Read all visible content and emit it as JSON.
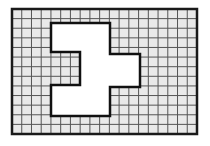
{
  "diagram": {
    "type": "grid-shape",
    "grid": {
      "cols": 19,
      "rows": 13,
      "x": 12,
      "y": 9,
      "width": 185,
      "height": 125,
      "fill": "#e9e9e9",
      "line_color": "#555555",
      "border_color": "#1a1a1a"
    },
    "shape": {
      "fill": "#ffffff",
      "stroke": "#111111",
      "points": [
        [
          51,
          23
        ],
        [
          110,
          23
        ],
        [
          110,
          54
        ],
        [
          140,
          54
        ],
        [
          140,
          87
        ],
        [
          110,
          87
        ],
        [
          110,
          116
        ],
        [
          51,
          116
        ],
        [
          51,
          85
        ],
        [
          80,
          85
        ],
        [
          80,
          52
        ],
        [
          51,
          52
        ]
      ]
    }
  }
}
